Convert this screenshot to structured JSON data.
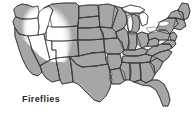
{
  "figure": {
    "caption": "Fireflies",
    "width": 193,
    "height": 122
  },
  "legend": {
    "present_label": "Fireflies",
    "present_color": "#a6a6a6",
    "absent_color": "#ffffff",
    "border_color": "#3a3a3a",
    "background_color": "#ffffff"
  },
  "map_data": {
    "type": "choropleth",
    "region": "United States",
    "title": "Fireflies",
    "categories": [
      "present",
      "absent"
    ],
    "present_fill": "#a6a6a6",
    "absent_fill": "#ffffff",
    "absent_states": [
      "Oregon",
      "Idaho",
      "Nevada",
      "Utah",
      "Wyoming",
      "Montana",
      "Colorado (western)",
      "Arizona (northern)"
    ],
    "present_states": [
      "Washington",
      "California",
      "Arizona (southern)",
      "New Mexico",
      "Texas",
      "Oklahoma",
      "Kansas",
      "Nebraska",
      "South Dakota",
      "North Dakota",
      "Minnesota",
      "Iowa",
      "Missouri",
      "Arkansas",
      "Louisiana",
      "Mississippi",
      "Alabama",
      "Georgia",
      "Florida",
      "South Carolina",
      "North Carolina",
      "Tennessee",
      "Kentucky",
      "Virginia",
      "West Virginia",
      "Ohio",
      "Indiana",
      "Illinois",
      "Wisconsin",
      "Michigan",
      "Pennsylvania",
      "New York",
      "Maryland",
      "Delaware",
      "New Jersey",
      "Connecticut",
      "Rhode Island",
      "Massachusetts",
      "Vermont",
      "New Hampshire",
      "Maine"
    ],
    "water_features": [
      "Lake Superior",
      "Lake Michigan",
      "Lake Huron",
      "Lake Erie",
      "Lake Ontario"
    ]
  }
}
